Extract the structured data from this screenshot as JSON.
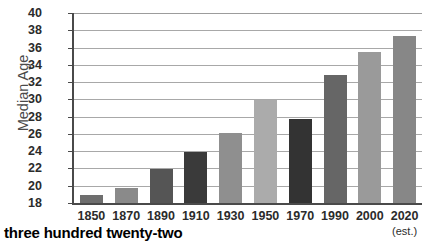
{
  "footer": {
    "text": "three hundred twenty-two"
  },
  "chart_data": {
    "type": "bar",
    "title": "",
    "xlabel": "",
    "ylabel": "Median Age",
    "ylim": [
      18,
      40
    ],
    "ytick_step": 2,
    "yticks": [
      40,
      38,
      36,
      34,
      32,
      30,
      28,
      26,
      24,
      22,
      20,
      18
    ],
    "grid": true,
    "legend": "none",
    "categories": [
      "1850",
      "1870",
      "1890",
      "1910",
      "1930",
      "1950",
      "1970",
      "1990",
      "2000",
      "2020"
    ],
    "category_sublabels": [
      "",
      "",
      "",
      "",
      "",
      "",
      "",
      "",
      "",
      "(est.)"
    ],
    "values": [
      18.9,
      19.7,
      21.9,
      23.9,
      26.1,
      29.9,
      27.7,
      32.8,
      35.5,
      37.3
    ],
    "bar_colors": [
      "#6e6e6e",
      "#8a8a8a",
      "#555555",
      "#3a3a3a",
      "#8f8f8f",
      "#ababab",
      "#333333",
      "#666666",
      "#9a9a9a",
      "#878787"
    ],
    "axis_color": "#4a4a4a",
    "gridline_color": "#a8a8a8",
    "background": "#ffffff"
  }
}
